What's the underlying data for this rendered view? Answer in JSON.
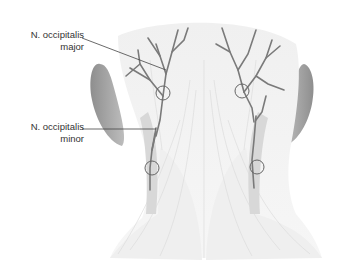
{
  "figure": {
    "labels": {
      "major": {
        "line1": "N. occipitalis",
        "line2": "major"
      },
      "minor": {
        "line1": "N. occipitalis",
        "line2": "minor"
      }
    },
    "colors": {
      "nerve": "#7a7a7a",
      "ear": "#9a9a9a",
      "skin": "#ececec",
      "muscle": "#f4f4f4",
      "leader_line": "#444444",
      "circle": "#666666"
    }
  }
}
